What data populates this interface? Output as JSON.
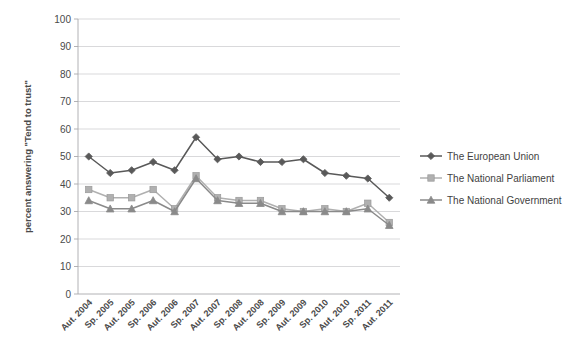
{
  "chart_data": {
    "type": "line",
    "title": "",
    "xlabel": "",
    "ylabel": "percent answering \"Tend to trust\"",
    "ylim": [
      0,
      100
    ],
    "ytick_step": 10,
    "yticks": [
      "0",
      "10",
      "20",
      "30",
      "40",
      "50",
      "60",
      "70",
      "80",
      "90",
      "100"
    ],
    "grid": true,
    "legend_position": "right",
    "categories": [
      "Aut. 2004",
      "Sp. 2005",
      "Aut. 2005",
      "Sp. 2006",
      "Aut. 2006",
      "Sp. 2007",
      "Aut. 2007",
      "Sp. 2008",
      "Aut. 2008",
      "Sp. 2009",
      "Aut. 2009",
      "Sp. 2010",
      "Aut. 2010",
      "Sp. 2011",
      "Aut. 2011"
    ],
    "series": [
      {
        "name": "The European Union",
        "marker": "diamond",
        "color": "#595959",
        "values": [
          50,
          44,
          45,
          48,
          45,
          57,
          49,
          50,
          48,
          48,
          49,
          44,
          43,
          42,
          35
        ]
      },
      {
        "name": "The National Parliament",
        "marker": "square",
        "color": "#b0b0b0",
        "values": [
          38,
          35,
          35,
          38,
          31,
          43,
          35,
          34,
          34,
          31,
          30,
          31,
          30,
          33,
          26
        ]
      },
      {
        "name": "The National Government",
        "marker": "triangle",
        "color": "#8a8a8a",
        "values": [
          34,
          31,
          31,
          34,
          30,
          42,
          34,
          33,
          33,
          30,
          30,
          30,
          30,
          31,
          25
        ]
      }
    ]
  },
  "legend": {
    "items": [
      {
        "label": "The European Union"
      },
      {
        "label": "The National Parliament"
      },
      {
        "label": "The National Government"
      }
    ]
  },
  "colors": {
    "eu": "#595959",
    "parliament": "#b0b0b0",
    "government": "#8a8a8a",
    "grid": "#c8c8cc",
    "axis": "#a9a9ad",
    "text": "#4a4a4a",
    "background": "#ffffff"
  }
}
